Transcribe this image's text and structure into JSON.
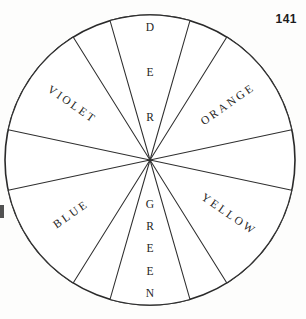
{
  "page": {
    "number": "141",
    "background_color": "#fdfdfc",
    "ink_color": "#2a2a2a"
  },
  "figure": {
    "name": "color-wheel",
    "center_x": 150,
    "center_y": 160,
    "radius": 145,
    "sector_fill": "#ffffff"
  },
  "chart_data": {
    "type": "pie",
    "title": "",
    "xlabel": "",
    "ylabel": "",
    "legend": "none",
    "grid": false,
    "categories": [
      "RED",
      "ORANGE",
      "YELLOW",
      "GREEN",
      "BLUE",
      "VIOLET"
    ],
    "values": [
      32,
      46,
      46,
      32,
      46,
      46
    ],
    "note": "Six labelled wedges separated by six unlabelled blank wedges around a circle.",
    "slices": [
      {
        "label": "RED",
        "start_angle": -106,
        "end_angle": -74,
        "orientation": "stacked",
        "letters": [
          "R",
          "E",
          "D"
        ],
        "label_radius": 0.62,
        "text_rotation": 0
      },
      {
        "label": "ORANGE",
        "start_angle": -58,
        "end_angle": -12,
        "orientation": "radial",
        "letters": [
          "O",
          "R",
          "A",
          "N",
          "G",
          "E"
        ],
        "label_radius": 0.66,
        "text_rotation": -35
      },
      {
        "label": "YELLOW",
        "start_angle": 12,
        "end_angle": 58,
        "orientation": "radial",
        "letters": [
          "Y",
          "E",
          "L",
          "L",
          "O",
          "W"
        ],
        "label_radius": 0.66,
        "text_rotation": 35
      },
      {
        "label": "GREEN",
        "start_angle": 74,
        "end_angle": 106,
        "orientation": "stacked",
        "letters": [
          "G",
          "R",
          "E",
          "E",
          "N"
        ],
        "label_radius": 0.62,
        "text_rotation": 0
      },
      {
        "label": "BLUE",
        "start_angle": 122,
        "end_angle": 168,
        "orientation": "radial",
        "letters": [
          "B",
          "L",
          "U",
          "E"
        ],
        "label_radius": 0.66,
        "text_rotation": -35
      },
      {
        "label": "VIOLET",
        "start_angle": 192,
        "end_angle": 238,
        "orientation": "radial",
        "letters": [
          "V",
          "I",
          "O",
          "L",
          "E",
          "T"
        ],
        "label_radius": 0.66,
        "text_rotation": 35
      }
    ],
    "blank_slices": [
      {
        "start_angle": -74,
        "end_angle": -58
      },
      {
        "start_angle": -12,
        "end_angle": 12
      },
      {
        "start_angle": 58,
        "end_angle": 74
      },
      {
        "start_angle": 106,
        "end_angle": 122
      },
      {
        "start_angle": 168,
        "end_angle": 192
      },
      {
        "start_angle": 238,
        "end_angle": 254
      }
    ]
  }
}
